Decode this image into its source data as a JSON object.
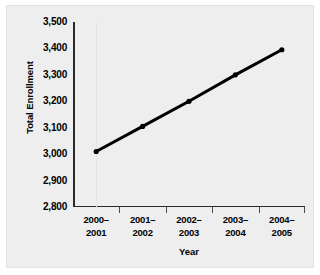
{
  "chart_data": {
    "type": "line",
    "title": "",
    "xlabel": "Year",
    "ylabel": "Total Enrollment",
    "categories": [
      "2000–2001",
      "2001–2002",
      "2002–2003",
      "2003–2004",
      "2004–2005"
    ],
    "category_lines": [
      [
        "2000–",
        "2001"
      ],
      [
        "2001–",
        "2002"
      ],
      [
        "2002–",
        "2003"
      ],
      [
        "2003–",
        "2004"
      ],
      [
        "2004–",
        "2005"
      ]
    ],
    "values": [
      3010,
      3105,
      3200,
      3300,
      3395
    ],
    "ylim": [
      2800,
      3500
    ],
    "yticks": [
      2800,
      2900,
      3000,
      3100,
      3200,
      3300,
      3400,
      3500
    ],
    "ytick_labels": [
      "2,800",
      "2,900",
      "3,000",
      "3,100",
      "3,200",
      "3,300",
      "3,400",
      "3,500"
    ],
    "grid": false,
    "legend": "none",
    "series_color": "#000000",
    "marker": "circle",
    "panel_background": "#eeeeee"
  }
}
